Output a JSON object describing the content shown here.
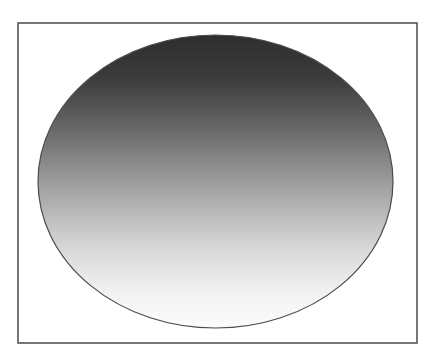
{
  "figure": {
    "frame": {
      "x": 18,
      "y": 23,
      "width": 399,
      "height": 320,
      "stroke": "#4a4a4a",
      "stroke_width": 1.5,
      "fill": "#ffffff"
    },
    "ellipse": {
      "cx": 215.5,
      "cy": 181.5,
      "rx": 177.5,
      "ry": 146.5,
      "stroke": "#4a4a4a",
      "stroke_width": 1.2
    },
    "gradient": {
      "direction": "vertical",
      "stops": [
        {
          "offset": "0%",
          "color": "#2e2e2e"
        },
        {
          "offset": "15%",
          "color": "#3c3c3c"
        },
        {
          "offset": "32%",
          "color": "#686868"
        },
        {
          "offset": "52%",
          "color": "#a2a2a2"
        },
        {
          "offset": "72%",
          "color": "#d6d6d6"
        },
        {
          "offset": "88%",
          "color": "#f2f2f2"
        },
        {
          "offset": "100%",
          "color": "#fcfcfc"
        }
      ]
    }
  }
}
